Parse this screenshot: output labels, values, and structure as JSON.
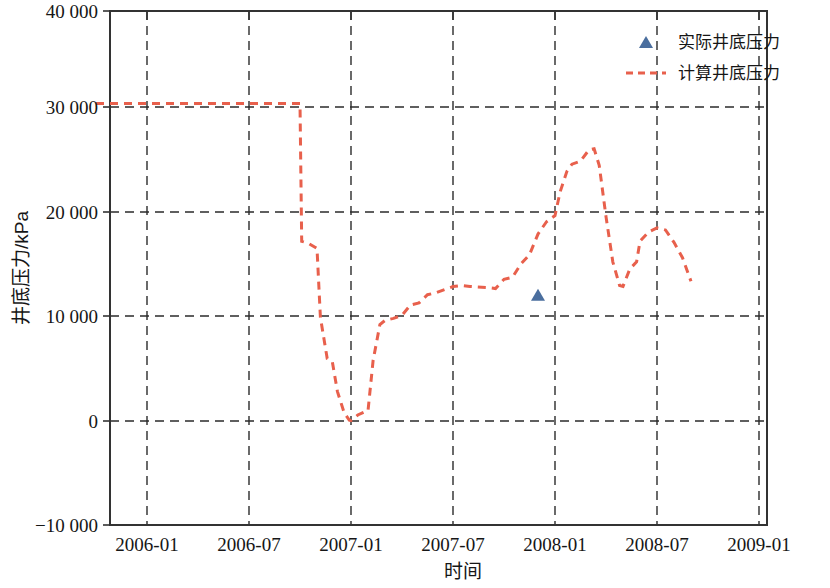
{
  "chart_data": {
    "type": "line",
    "title": "",
    "xlabel": "时间",
    "ylabel": "井底压力/kPa",
    "grid": true,
    "legend_position": "top-right",
    "xlim": [
      "2005-10",
      "2009-01"
    ],
    "ylim": [
      -10000,
      40000
    ],
    "x_tick_labels": [
      "2006-01",
      "2006-07",
      "2007-01",
      "2007-07",
      "2008-01",
      "2008-07",
      "2009-01"
    ],
    "y_tick_labels": [
      "-10 000",
      "0",
      "10 000",
      "20 000",
      "30 000",
      "40 000"
    ],
    "y_ticks": [
      -10000,
      0,
      10000,
      20000,
      30000,
      40000
    ],
    "series": [
      {
        "name": "实际井底压力",
        "type": "scatter",
        "marker": "triangle",
        "color": "#4a6e9e",
        "points": [
          {
            "x": "2007-12",
            "y": 12400
          }
        ]
      },
      {
        "name": "计算井底压力",
        "type": "line",
        "style": "dashed",
        "color": "#e8604c",
        "points": [
          {
            "x": "2005-10",
            "y": 31000
          },
          {
            "x": "2006-01",
            "y": 31000
          },
          {
            "x": "2006-04",
            "y": 31000
          },
          {
            "x": "2006-07",
            "y": 31000
          },
          {
            "x": "2006-09",
            "y": 31000
          },
          {
            "x": "2006-10",
            "y": 31000
          },
          {
            "x": "2006-10.1",
            "y": 17600
          },
          {
            "x": "2006-10.5",
            "y": 17400
          },
          {
            "x": "2006-11",
            "y": 16900
          },
          {
            "x": "2006-11.2",
            "y": 10200
          },
          {
            "x": "2006-11.6",
            "y": 6200
          },
          {
            "x": "2006-11.9",
            "y": 5900
          },
          {
            "x": "2006-12.2",
            "y": 3000
          },
          {
            "x": "2006-12.6",
            "y": 900
          },
          {
            "x": "2006-12.9",
            "y": 200
          },
          {
            "x": "2007-01",
            "y": 150
          },
          {
            "x": "2007-01.4",
            "y": 700
          },
          {
            "x": "2007-01.8",
            "y": 1000
          },
          {
            "x": "2007-02",
            "y": 1100
          },
          {
            "x": "2007-02.3",
            "y": 6000
          },
          {
            "x": "2007-02.7",
            "y": 9500
          },
          {
            "x": "2007-03",
            "y": 9900
          },
          {
            "x": "2007-03.5",
            "y": 10100
          },
          {
            "x": "2007-04",
            "y": 10400
          },
          {
            "x": "2007-04.5",
            "y": 11400
          },
          {
            "x": "2007-05",
            "y": 11600
          },
          {
            "x": "2007-05.5",
            "y": 12400
          },
          {
            "x": "2007-06",
            "y": 12600
          },
          {
            "x": "2007-07",
            "y": 13200
          },
          {
            "x": "2007-07.5",
            "y": 13300
          },
          {
            "x": "2007-08",
            "y": 13200
          },
          {
            "x": "2007-09",
            "y": 13100
          },
          {
            "x": "2007-09.5",
            "y": 13000
          },
          {
            "x": "2007-10",
            "y": 13900
          },
          {
            "x": "2007-10.5",
            "y": 14100
          },
          {
            "x": "2007-11",
            "y": 15400
          },
          {
            "x": "2007-11.5",
            "y": 16300
          },
          {
            "x": "2007-12",
            "y": 18300
          },
          {
            "x": "2007-12.5",
            "y": 19500
          },
          {
            "x": "2008-01",
            "y": 20100
          },
          {
            "x": "2008-01.3",
            "y": 22400
          },
          {
            "x": "2008-01.7",
            "y": 24400
          },
          {
            "x": "2008-02",
            "y": 25100
          },
          {
            "x": "2008-02.5",
            "y": 25400
          },
          {
            "x": "2008-03",
            "y": 26500
          },
          {
            "x": "2008-03.3",
            "y": 26600
          },
          {
            "x": "2008-03.6",
            "y": 25000
          },
          {
            "x": "2008-04",
            "y": 20000
          },
          {
            "x": "2008-04.4",
            "y": 15600
          },
          {
            "x": "2008-04.8",
            "y": 13300
          },
          {
            "x": "2008-05",
            "y": 13200
          },
          {
            "x": "2008-05.4",
            "y": 14900
          },
          {
            "x": "2008-05.8",
            "y": 15600
          },
          {
            "x": "2008-06",
            "y": 17600
          },
          {
            "x": "2008-06.5",
            "y": 18500
          },
          {
            "x": "2008-07",
            "y": 18900
          },
          {
            "x": "2008-07.5",
            "y": 18700
          },
          {
            "x": "2008-08",
            "y": 17500
          },
          {
            "x": "2008-08.5",
            "y": 16000
          },
          {
            "x": "2008-09",
            "y": 13700
          }
        ]
      }
    ]
  },
  "axes": {
    "y_label": "井底压力/kPa",
    "x_label": "时间",
    "y_tick_0": "40 000",
    "y_tick_1": "30 000",
    "y_tick_2": "20 000",
    "y_tick_3": "10 000",
    "y_tick_4": "0",
    "y_tick_5": "−10 000",
    "x_tick_0": "2006-01",
    "x_tick_1": "2006-07",
    "x_tick_2": "2007-01",
    "x_tick_3": "2007-07",
    "x_tick_4": "2008-01",
    "x_tick_5": "2008-07",
    "x_tick_6": "2009-01"
  },
  "legend": {
    "entry_measured": "实际井底压力",
    "entry_calculated": "计算井底压力",
    "measured_color": "#4a6e9e",
    "calculated_color": "#e8604c"
  }
}
